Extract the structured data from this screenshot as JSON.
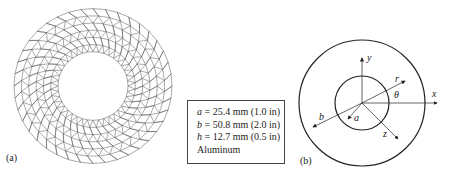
{
  "panel_a": {
    "label": "(a)",
    "description": "Finite element triangular mesh of an annular disk"
  },
  "properties_box": {
    "lines": [
      {
        "symbol": "a",
        "text": " = 25.4 mm (1.0 in)"
      },
      {
        "symbol": "b",
        "text": " = 50.8 mm (2.0 in)"
      },
      {
        "symbol": "h",
        "text": " = 12.7 mm (0.5 in)"
      }
    ],
    "material": "Aluminum"
  },
  "panel_b": {
    "label": "(b)",
    "axis_labels": {
      "x": "x",
      "y": "y",
      "z": "z",
      "r": "r",
      "theta": "θ",
      "a": "a",
      "b": "b"
    }
  },
  "colors": {
    "line": "#222222",
    "mesh": "#555555",
    "background": "#ffffff"
  }
}
